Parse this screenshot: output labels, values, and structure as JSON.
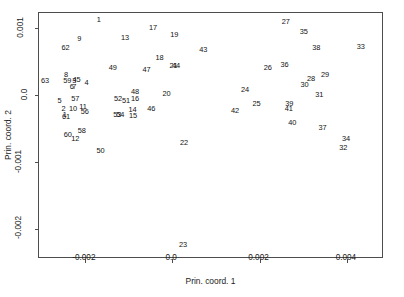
{
  "chart_data": {
    "type": "scatter",
    "title": "",
    "xlabel": "Prin. coord. 1",
    "ylabel": "Prin. coord. 2",
    "xlim": [
      -0.00305,
      0.00485
    ],
    "ylim": [
      -0.00245,
      0.00123
    ],
    "xticks": [
      -0.002,
      0.0,
      0.002,
      0.004
    ],
    "xticklabels": [
      "-0.002",
      "0.0",
      "0.002",
      "0.004"
    ],
    "yticks": [
      0.001,
      0.0,
      -0.001,
      -0.002
    ],
    "yticklabels": [
      "0.001",
      "0.0",
      "-0.001",
      "-0.002"
    ],
    "grid": false,
    "legend": null,
    "marker_style": "text-label",
    "note": "Points are drawn as their numeric sample labels (1-63) instead of markers.",
    "points": [
      {
        "label": "1",
        "x": -0.00168,
        "y": 0.00113
      },
      {
        "label": "17",
        "x": -0.00044,
        "y": 0.001
      },
      {
        "label": "27",
        "x": 0.0026,
        "y": 0.0011
      },
      {
        "label": "9",
        "x": -0.00213,
        "y": 0.00084
      },
      {
        "label": "13",
        "x": -0.00108,
        "y": 0.00085
      },
      {
        "label": "19",
        "x": 5e-05,
        "y": 0.0009
      },
      {
        "label": "35",
        "x": 0.00301,
        "y": 0.00094
      },
      {
        "label": "62",
        "x": -0.00244,
        "y": 0.0007
      },
      {
        "label": "43",
        "x": 0.00071,
        "y": 0.00067
      },
      {
        "label": "38",
        "x": 0.0033,
        "y": 0.0007
      },
      {
        "label": "33",
        "x": 0.00432,
        "y": 0.00072
      },
      {
        "label": "18",
        "x": -0.00029,
        "y": 0.00055
      },
      {
        "label": "49",
        "x": -0.00136,
        "y": 0.0004
      },
      {
        "label": "47",
        "x": -0.00059,
        "y": 0.00038
      },
      {
        "label": "21",
        "x": 3e-05,
        "y": 0.00043
      },
      {
        "label": "44",
        "x": 9e-05,
        "y": 0.00043
      },
      {
        "label": "26",
        "x": 0.00219,
        "y": 0.0004
      },
      {
        "label": "36",
        "x": 0.00257,
        "y": 0.00045
      },
      {
        "label": "29",
        "x": 0.0035,
        "y": 0.0003
      },
      {
        "label": "28",
        "x": 0.00318,
        "y": 0.00024
      },
      {
        "label": "63",
        "x": -0.00291,
        "y": 0.00021
      },
      {
        "label": "8",
        "x": -0.00243,
        "y": 0.0003
      },
      {
        "label": "59",
        "x": -0.0024,
        "y": 0.00021
      },
      {
        "label": "3",
        "x": -0.00224,
        "y": 0.00022
      },
      {
        "label": "45",
        "x": -0.00219,
        "y": 0.00023
      },
      {
        "label": "6",
        "x": -0.0023,
        "y": 0.00013
      },
      {
        "label": "7",
        "x": -0.00224,
        "y": 0.00013
      },
      {
        "label": "4",
        "x": -0.00196,
        "y": 0.00018
      },
      {
        "label": "30",
        "x": 0.00303,
        "y": 0.00016
      },
      {
        "label": "48",
        "x": -0.00085,
        "y": 5e-05
      },
      {
        "label": "20",
        "x": -0.00013,
        "y": 2e-05
      },
      {
        "label": "24",
        "x": 0.00167,
        "y": 8e-05
      },
      {
        "label": "31",
        "x": 0.00337,
        "y": 1e-05
      },
      {
        "label": "5",
        "x": -0.00258,
        "y": -8e-05
      },
      {
        "label": "57",
        "x": -0.00222,
        "y": -5e-05
      },
      {
        "label": "52",
        "x": -0.00124,
        "y": -5e-05
      },
      {
        "label": "51",
        "x": -0.00106,
        "y": -9e-05
      },
      {
        "label": "16",
        "x": -0.00085,
        "y": -5e-05
      },
      {
        "label": "25",
        "x": 0.00193,
        "y": -0.00013
      },
      {
        "label": "39",
        "x": 0.00268,
        "y": -0.00013
      },
      {
        "label": "46",
        "x": -0.00048,
        "y": -0.0002
      },
      {
        "label": "2",
        "x": -0.00249,
        "y": -0.00021
      },
      {
        "label": "10",
        "x": -0.00227,
        "y": -0.00021
      },
      {
        "label": "11",
        "x": -0.00204,
        "y": -0.00018
      },
      {
        "label": "56",
        "x": -0.002,
        "y": -0.00025
      },
      {
        "label": "14",
        "x": -0.00091,
        "y": -0.00022
      },
      {
        "label": "41",
        "x": 0.00267,
        "y": -0.00021
      },
      {
        "label": "42",
        "x": 0.00144,
        "y": -0.00024
      },
      {
        "label": "61",
        "x": -0.00243,
        "y": -0.00032
      },
      {
        "label": "1b",
        "x": -0.00246,
        "y": -0.00029
      },
      {
        "label": "53",
        "x": -0.00126,
        "y": -0.0003
      },
      {
        "label": "54",
        "x": -0.00119,
        "y": -0.0003
      },
      {
        "label": "15",
        "x": -0.0009,
        "y": -0.00031
      },
      {
        "label": "37",
        "x": 0.00344,
        "y": -0.00049
      },
      {
        "label": "40",
        "x": 0.00275,
        "y": -0.00042
      },
      {
        "label": "60",
        "x": -0.00239,
        "y": -0.00059
      },
      {
        "label": "34",
        "x": 0.00398,
        "y": -0.00066
      },
      {
        "label": "58",
        "x": -0.00207,
        "y": -0.00053
      },
      {
        "label": "12",
        "x": -0.00222,
        "y": -0.00065
      },
      {
        "label": "22",
        "x": 0.00027,
        "y": -0.00071
      },
      {
        "label": "32",
        "x": 0.00392,
        "y": -0.00079
      },
      {
        "label": "50",
        "x": -0.00164,
        "y": -0.00084
      },
      {
        "label": "23",
        "x": 0.00025,
        "y": -0.00224
      }
    ]
  },
  "axes": {
    "xlabel": "Prin. coord. 1",
    "ylabel": "Prin. coord. 2"
  },
  "colors": {
    "frame": "#4d4d4d",
    "text": "#1a1a1a",
    "background": "#ffffff"
  }
}
